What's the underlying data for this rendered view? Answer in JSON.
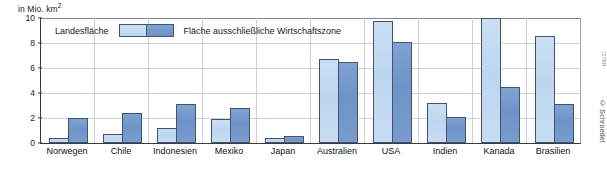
{
  "chart_data": {
    "type": "bar",
    "title": "",
    "unit_label": "in Mio. km",
    "unit_exponent": "2",
    "xlabel": "",
    "ylabel": "in Mio. km²",
    "ylim": [
      0,
      10
    ],
    "yticks": [
      0,
      2,
      4,
      6,
      8,
      10
    ],
    "ytick_labels": [
      "0",
      "2",
      "4",
      "6",
      "8",
      "10"
    ],
    "grid": true,
    "legend_position": "top-left-inside",
    "categories": [
      "Norwegen",
      "Chile",
      "Indonesien",
      "Mexiko",
      "Japan",
      "Australien",
      "USA",
      "Indien",
      "Kanada",
      "Brasilien"
    ],
    "series": [
      {
        "name": "Landesfläche",
        "color": "#bdd6ef",
        "values": [
          0.4,
          0.7,
          1.2,
          1.9,
          0.4,
          6.7,
          9.8,
          3.2,
          10.0,
          8.6
        ]
      },
      {
        "name": "Fläche ausschließliche Wirtschaftszone",
        "color": "#6d93c8",
        "values": [
          2.0,
          2.4,
          3.1,
          2.8,
          0.6,
          6.5,
          8.1,
          2.1,
          4.5,
          3.1
        ]
      }
    ]
  },
  "legend": {
    "item1_label": "Landesfläche",
    "item2_label": "Fläche ausschließliche Wirtschaftszone"
  },
  "credit": {
    "text": "© Schroedel",
    "code": "727BH"
  },
  "colors": {
    "bar_light": "#bdd6ef",
    "bar_dark": "#6d93c8",
    "bar_outline": "#44536b",
    "gridline": "#c9d2da",
    "axis": "#3a3a3a"
  }
}
